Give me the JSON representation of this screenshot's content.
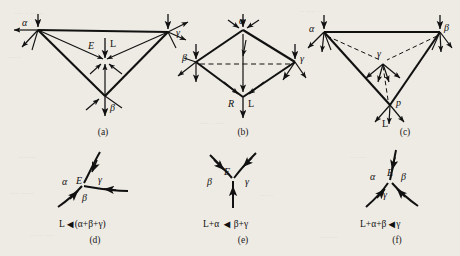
{
  "figure": {
    "kind": "scientific-diagram",
    "layout": "2 rows x 3 columns of labelled vector/graph diagrams",
    "background_color": "#eeebe4",
    "ink_color": "#111111",
    "panels": [
      {
        "id": "a",
        "caption": "(a)",
        "shape": "triangle",
        "node_labels": [
          "α",
          "γ",
          "β"
        ],
        "interior_labels": [
          "E",
          "L"
        ],
        "dashed_edges": false
      },
      {
        "id": "b",
        "caption": "(b)",
        "shape": "quadrilateral",
        "node_labels": [
          "α",
          "β",
          "γ"
        ],
        "interior_labels": [
          "R",
          "L"
        ],
        "dashed_edges": true
      },
      {
        "id": "c",
        "caption": "(c)",
        "shape": "triangle",
        "node_labels": [
          "α",
          "β",
          "γ",
          "p"
        ],
        "interior_labels": [
          "L"
        ],
        "dashed_edges": true
      },
      {
        "id": "d",
        "caption": "(d)",
        "shape": "three-way-junction",
        "node_labels": [
          "α",
          "E",
          "γ",
          "β"
        ],
        "formula": "L ◄ (α+β+γ)",
        "formula_lhs": "L",
        "formula_rhs": "(α+β+γ)",
        "formula_arrow": "◄"
      },
      {
        "id": "e",
        "caption": "(e)",
        "shape": "three-way-junction",
        "node_labels": [
          "β",
          "E",
          "γ"
        ],
        "formula": "L+α ◄ β+γ",
        "formula_lhs": "L+α",
        "formula_rhs": "β+γ",
        "formula_arrow": "◄"
      },
      {
        "id": "f",
        "caption": "(f)",
        "shape": "three-way-junction",
        "node_labels": [
          "α",
          "E",
          "β",
          "γ"
        ],
        "formula": "L+α+β ◄ γ",
        "formula_lhs": "L+α+β",
        "formula_rhs": "γ",
        "formula_arrow": "◄"
      }
    ]
  },
  "glyphs": {
    "alpha": "α",
    "beta": "β",
    "gamma": "γ",
    "E": "E",
    "L": "L",
    "R": "R",
    "p": "p",
    "arrow_left": "◄",
    "plus": "+"
  }
}
